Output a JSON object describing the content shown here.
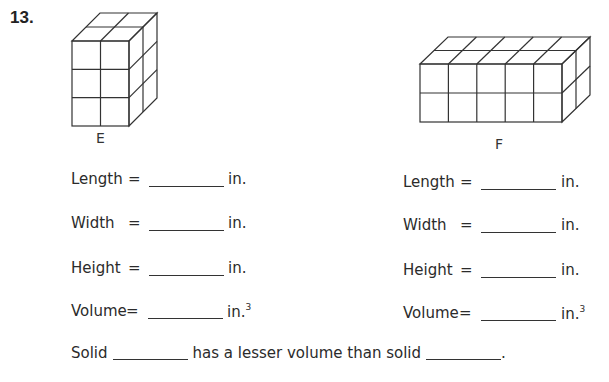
{
  "problem": {
    "number": "13."
  },
  "solids": [
    {
      "label": "E",
      "dimensions_in_cubes": {
        "length": 2,
        "width": 2,
        "height": 3
      },
      "fields": [
        {
          "label": "Length",
          "eq": "=",
          "value": "",
          "unit": "in.",
          "sup": ""
        },
        {
          "label": "Width",
          "eq": "=",
          "value": "",
          "unit": "in.",
          "sup": ""
        },
        {
          "label": "Height",
          "eq": "=",
          "value": "",
          "unit": "in.",
          "sup": ""
        },
        {
          "label": "Volume",
          "eq": "=",
          "value": "",
          "unit": "in.",
          "sup": "3"
        }
      ]
    },
    {
      "label": "F",
      "dimensions_in_cubes": {
        "length": 5,
        "width": 2,
        "height": 2
      },
      "fields": [
        {
          "label": "Length",
          "eq": "=",
          "value": "",
          "unit": "in.",
          "sup": ""
        },
        {
          "label": "Width",
          "eq": "=",
          "value": "",
          "unit": "in.",
          "sup": ""
        },
        {
          "label": "Height",
          "eq": "=",
          "value": "",
          "unit": "in.",
          "sup": ""
        },
        {
          "label": "Volume",
          "eq": "=",
          "value": "",
          "unit": "in.",
          "sup": "3"
        }
      ]
    }
  ],
  "comparison": {
    "prefix": "Solid",
    "middle": "has a lesser volume than solid",
    "suffix": ".",
    "blank1": "",
    "blank2": ""
  }
}
